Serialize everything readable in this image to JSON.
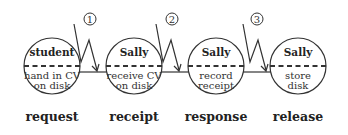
{
  "diagram": {
    "type": "process-flow",
    "nodes": [
      {
        "role": "student",
        "action_line1": "hand in CV",
        "action_line2": "on disk",
        "phase": "request"
      },
      {
        "role": "Sally",
        "action_line1": "receive CV",
        "action_line2": "on disk",
        "phase": "receipt"
      },
      {
        "role": "Sally",
        "action_line1": "record",
        "action_line2": "receipt",
        "phase": "response"
      },
      {
        "role": "Sally",
        "action_line1": "store",
        "action_line2": "disk",
        "phase": "release"
      }
    ],
    "transitions": [
      {
        "number": "1"
      },
      {
        "number": "2"
      },
      {
        "number": "3"
      }
    ],
    "colors": {
      "stroke": "#333333",
      "background": "#ffffff"
    }
  }
}
